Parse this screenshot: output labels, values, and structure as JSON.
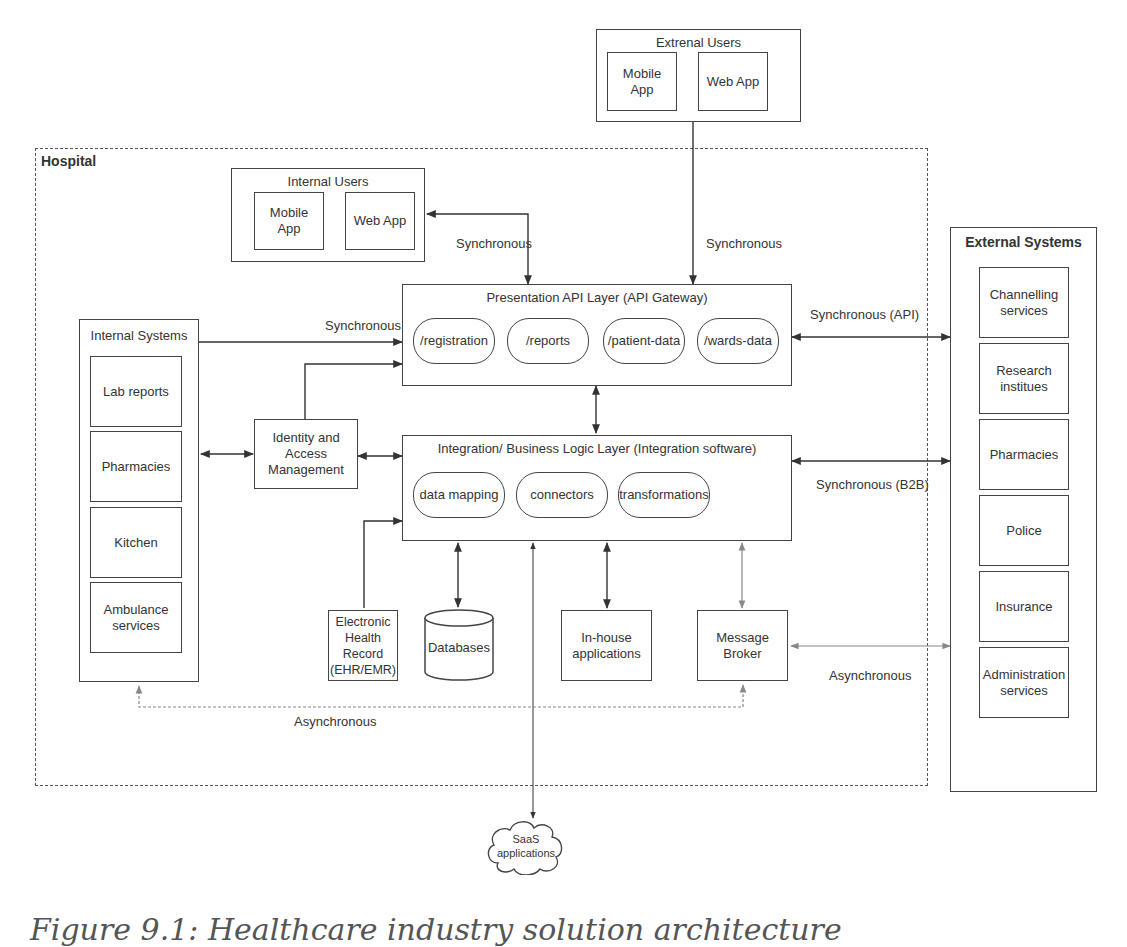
{
  "hospital": {
    "label": "Hospital"
  },
  "external_users": {
    "title": "Extrenal Users",
    "items": [
      "Mobile App",
      "Web App"
    ]
  },
  "internal_users": {
    "title": "Internal Users",
    "items": [
      "Mobile App",
      "Web App"
    ]
  },
  "presentation_layer": {
    "title": "Presentation API Layer (API Gateway)",
    "endpoints": [
      "/registration",
      "/reports",
      "/patient-data",
      "/wards-data"
    ]
  },
  "integration_layer": {
    "title": "Integration/ Business Logic Layer (Integration software)",
    "components": [
      "data mapping",
      "connectors",
      "transformations"
    ]
  },
  "internal_systems": {
    "title": "Internal Systems",
    "items": [
      "Lab reports",
      "Pharmacies",
      "Kitchen",
      "Ambulance services"
    ]
  },
  "external_systems": {
    "title": "External Systems",
    "items": [
      "Channelling services",
      "Research institues",
      "Pharmacies",
      "Police",
      "Insurance",
      "Administration services"
    ]
  },
  "iam": {
    "label": "Identity and Access Management"
  },
  "ehr": {
    "label": "Electronic Health Record (EHR/EMR)"
  },
  "databases": {
    "label": "Databases"
  },
  "inhouse": {
    "label": "In-house applications"
  },
  "broker": {
    "label": "Message Broker"
  },
  "saas": {
    "label": "SaaS applications"
  },
  "connections": {
    "internal_users_sync": "Synchronous",
    "external_users_sync": "Synchronous",
    "internal_systems_sync": "Synchronous",
    "external_api_sync": "Synchronous (API)",
    "external_b2b_sync": "Synchronous (B2B)",
    "broker_async": "Asynchronous",
    "internal_async": "Asynchronous"
  },
  "caption": "Figure 9.1: Healthcare industry solution architecture"
}
